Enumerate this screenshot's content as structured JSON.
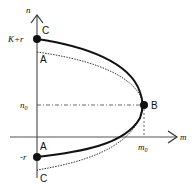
{
  "diagram": {
    "axes": {
      "x_label": "m",
      "y_label": "n"
    },
    "ticks": {
      "y_top": "K+r",
      "y_mid": "n",
      "y_mid_sub": "0",
      "y_bottom": "-r",
      "x_mid": "m",
      "x_mid_sub": "0"
    },
    "points": {
      "top_solid": "C",
      "top_dotted": "A",
      "vertex": "B",
      "bottom_solid": "A",
      "bottom_dotted": "C"
    },
    "colors": {
      "axis": "#555555",
      "curve": "#111111",
      "dotted": "#333333"
    }
  }
}
